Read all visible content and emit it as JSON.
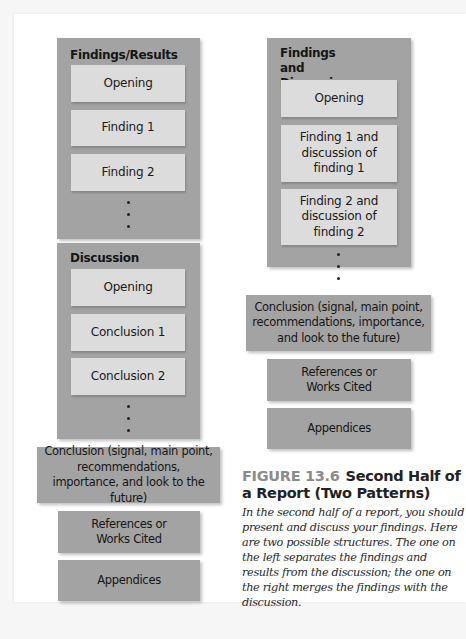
{
  "left_pattern": {
    "findings_section": {
      "title": "Findings/Results",
      "items": [
        "Opening",
        "Finding 1",
        "Finding 2"
      ],
      "continuation": "⋮"
    },
    "discussion_section": {
      "title": "Discussion",
      "items": [
        "Opening",
        "Conclusion 1",
        "Conclusion 2"
      ],
      "continuation": "⋮"
    },
    "conclusion": "Conclusion (signal, main point, recommendations, importance, and look to the future)",
    "references": "References or Works Cited",
    "appendices": "Appendices"
  },
  "right_pattern": {
    "findings_discussion_section": {
      "title": "Findings and Discussion",
      "items": [
        "Opening",
        "Finding 1 and discussion of finding 1",
        "Finding 2 and discussion of finding 2"
      ],
      "continuation": "⋮"
    },
    "conclusion": "Conclusion (signal, main point, recommendations, importance, and look to the future)",
    "references": "References or Works Cited",
    "appendices": "Appendices"
  },
  "caption": {
    "figure_label": "FIGURE 13.6",
    "title": "Second Half of a Report (Two Patterns)",
    "body": "In the second half of a report, you should present and discuss your findings. Here are two possible structures. The one on the left separates the findings and results from the discussion; the one on the right merges the findings with the discussion."
  },
  "colors": {
    "section_fill": "#a3a3a3",
    "item_fill": "#dcdcdc",
    "figure_label": "#8b8b8b"
  }
}
